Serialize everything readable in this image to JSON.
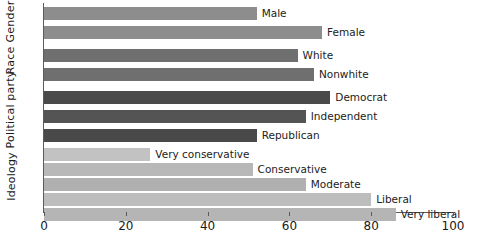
{
  "chart_data": {
    "type": "bar",
    "orientation": "horizontal",
    "title": "",
    "xlabel": "",
    "ylabel": "",
    "xlim": [
      0,
      100
    ],
    "xticks": [
      0,
      20,
      40,
      60,
      80,
      100
    ],
    "grid": false,
    "legend": null,
    "groups": [
      {
        "name": "Gender",
        "categories": [
          "Male",
          "Female"
        ],
        "values": [
          52,
          68
        ],
        "color": "#8d8d8d"
      },
      {
        "name": "Race",
        "categories": [
          "White",
          "Nonwhite"
        ],
        "values": [
          62,
          66
        ],
        "color": "#6f6f6f"
      },
      {
        "name": "Political party",
        "categories": [
          "Democrat",
          "Independent",
          "Republican"
        ],
        "values": [
          70,
          64,
          52
        ],
        "color": "#545454"
      },
      {
        "name": "Ideology",
        "categories": [
          "Very conservative",
          "Conservative",
          "Moderate",
          "Liberal",
          "Very liberal"
        ],
        "values": [
          26,
          51,
          64,
          80,
          86
        ],
        "color": "#b3b3b3"
      }
    ],
    "categories": [
      "Male",
      "Female",
      "White",
      "Nonwhite",
      "Democrat",
      "Independent",
      "Republican",
      "Very conservative",
      "Conservative",
      "Moderate",
      "Liberal",
      "Very liberal"
    ],
    "values": [
      52,
      68,
      62,
      66,
      70,
      64,
      52,
      26,
      51,
      64,
      80,
      86
    ]
  },
  "axis": {
    "tick_labels": [
      "0",
      "20",
      "40",
      "60",
      "80",
      "100"
    ]
  },
  "group_labels": {
    "gender": "Gender",
    "race": "Race",
    "political_party": "Political party",
    "ideology": "Ideology"
  },
  "bars": [
    {
      "label": "Male",
      "value": 52,
      "color": "#8d8d8d"
    },
    {
      "label": "Female",
      "value": 68,
      "color": "#8d8d8d"
    },
    {
      "label": "White",
      "value": 62,
      "color": "#6f6f6f"
    },
    {
      "label": "Nonwhite",
      "value": 66,
      "color": "#6f6f6f"
    },
    {
      "label": "Democrat",
      "value": 70,
      "color": "#4a4a4a"
    },
    {
      "label": "Independent",
      "value": 64,
      "color": "#545454"
    },
    {
      "label": "Republican",
      "value": 52,
      "color": "#494949"
    },
    {
      "label": "Very conservative",
      "value": 26,
      "color": "#c2c2c2"
    },
    {
      "label": "Conservative",
      "value": 51,
      "color": "#b8b8b8"
    },
    {
      "label": "Moderate",
      "value": 64,
      "color": "#b0b0b0"
    },
    {
      "label": "Liberal",
      "value": 80,
      "color": "#bdbdbd"
    },
    {
      "label": "Very liberal",
      "value": 86,
      "color": "#b5b5b5"
    }
  ],
  "colors": {
    "axis": "#5b5b5b",
    "text": "#1a1a1a",
    "background": "#ffffff"
  }
}
